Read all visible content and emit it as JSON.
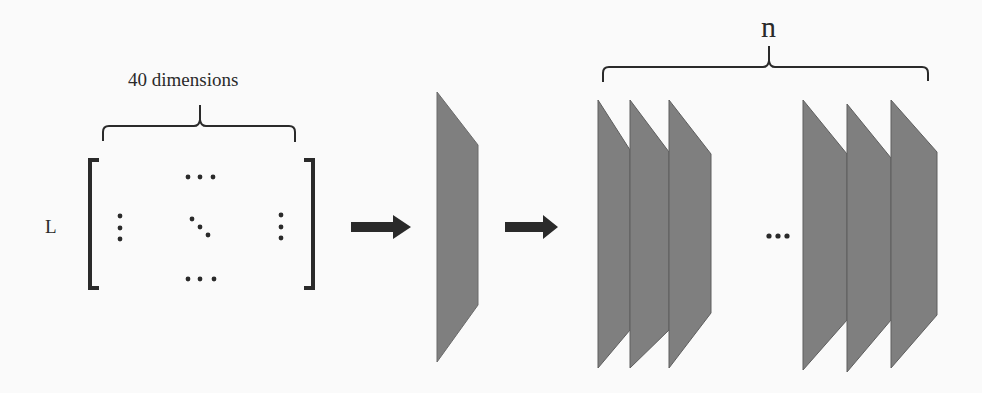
{
  "figure": {
    "labels": {
      "matrix_width": "40 dimensions",
      "matrix_rows": "L",
      "layer_count": "n"
    },
    "elements": {
      "input": "matrix (L × 40)",
      "flow_arrows": 2,
      "first_layer_slabs": 1,
      "stacked_layer_groups": 2,
      "slabs_per_group": 3,
      "group_separator": "..."
    },
    "colors": {
      "background": "#fafafa",
      "slab_fill": "#7f7f7f",
      "slab_edge": "#5a5a5a",
      "ink": "#2a2a2a"
    }
  }
}
